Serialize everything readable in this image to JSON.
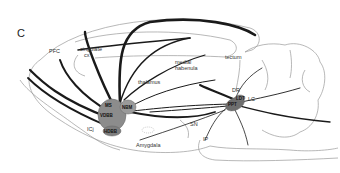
{
  "figure": {
    "panel_label": "C"
  },
  "regions": {
    "pfc": "PFC",
    "cingulate": "cingulate",
    "cingulate_cx": "cx",
    "thalamus": "thalamus",
    "medial": "medial",
    "habenula": "habenula",
    "tectum": "tectum",
    "dr": "DR",
    "lc": "LC",
    "sn": "SN",
    "ip": "IP",
    "icj": "ICj",
    "amygdala": "Amygdala"
  },
  "nuclei": {
    "ms": "MS",
    "vdbb": "VDBB",
    "nbm": "NBM",
    "hdbb": "HDBB",
    "ldt": "LDT",
    "ppt": "PPT"
  },
  "colors": {
    "outline": "#9a9a9a",
    "pathway": "#1a1a1a",
    "nucleus_fill": "#8c8c8c",
    "nucleus_dark": "#6e6e6e"
  }
}
